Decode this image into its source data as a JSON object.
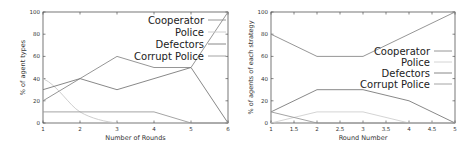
{
  "chart_data": [
    {
      "type": "line",
      "title": "",
      "xlabel": "Number of Rounds",
      "ylabel": "% of agent types",
      "xlim": [
        1,
        6
      ],
      "ylim": [
        0,
        100
      ],
      "x_ticks": [
        "1",
        "2",
        "3",
        "4",
        "5",
        "6"
      ],
      "y_ticks": [
        "0",
        "20",
        "40",
        "60",
        "80",
        "100"
      ],
      "grid": false,
      "legend_position": "top-right",
      "x": [
        1,
        2,
        3,
        4,
        5,
        6
      ],
      "series": [
        {
          "name": "Cooperator",
          "color": "#8a8a8a",
          "values": [
            20,
            40,
            60,
            50,
            50,
            100
          ]
        },
        {
          "name": "Police",
          "color": "#c8c8c8",
          "values": [
            40,
            10,
            0,
            null,
            null,
            null
          ]
        },
        {
          "name": "Defectors",
          "color": "#7a7a7a",
          "values": [
            30,
            40,
            30,
            40,
            50,
            0
          ]
        },
        {
          "name": "Corrupt Police",
          "color": "#9a9a9a",
          "values": [
            10,
            10,
            10,
            10,
            0,
            0
          ]
        }
      ]
    },
    {
      "type": "line",
      "title": "",
      "xlabel": "Round Number",
      "ylabel": "% of agents of each strategy",
      "xlim": [
        1,
        5
      ],
      "ylim": [
        0,
        100
      ],
      "x_ticks": [
        "1",
        "1.5",
        "2",
        "2.5",
        "3",
        "3.5",
        "4",
        "4.5",
        "5"
      ],
      "y_ticks": [
        "0",
        "20",
        "40",
        "60",
        "80",
        "100"
      ],
      "grid": false,
      "legend_position": "center-right",
      "x": [
        1,
        2,
        3,
        4,
        5
      ],
      "series": [
        {
          "name": "Cooperator",
          "color": "#8a8a8a",
          "values": [
            80,
            60,
            60,
            80,
            100
          ]
        },
        {
          "name": "Police",
          "color": "#cfcfcf",
          "values": [
            0,
            10,
            10,
            0,
            0
          ]
        },
        {
          "name": "Defectors",
          "color": "#7a7a7a",
          "values": [
            10,
            30,
            30,
            20,
            0
          ]
        },
        {
          "name": "Corrupt Police",
          "color": "#9a9a9a",
          "values": [
            10,
            0,
            0,
            0,
            0
          ]
        }
      ]
    }
  ],
  "left": {
    "xlabel": "Number of Rounds",
    "ylabel": "% of agent types",
    "legend": [
      "Cooperator",
      "Police",
      "Defectors",
      "Corrupt Police"
    ]
  },
  "right": {
    "xlabel": "Round Number",
    "ylabel": "% of agents of each strategy",
    "legend": [
      "Cooperator",
      "Police",
      "Defectors",
      "Corrupt Police"
    ]
  }
}
